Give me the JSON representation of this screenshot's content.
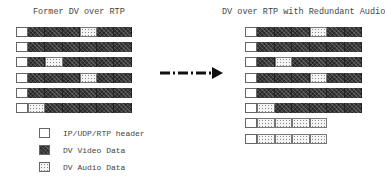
{
  "left_panel": {
    "title": "Former DV over RTP",
    "x": 16,
    "segment_width": 17.3,
    "rows": [
      {
        "y": 27,
        "segments": [
          "video",
          "video",
          "video",
          "audio",
          "video",
          "video"
        ]
      },
      {
        "y": 42,
        "segments": [
          "video",
          "video",
          "video",
          "video",
          "video",
          "video"
        ]
      },
      {
        "y": 57,
        "segments": [
          "video",
          "audio",
          "video",
          "video",
          "video",
          "video"
        ]
      },
      {
        "y": 73,
        "segments": [
          "video",
          "video",
          "video",
          "audio",
          "video",
          "video"
        ]
      },
      {
        "y": 88,
        "segments": [
          "video",
          "video",
          "video",
          "video",
          "video",
          "video"
        ]
      },
      {
        "y": 103,
        "segments": [
          "audio",
          "video",
          "video",
          "video",
          "video",
          "video"
        ]
      }
    ]
  },
  "right_panel": {
    "title": "DV over RTP with Redundant Audio",
    "x": 245,
    "segment_width": 17.5,
    "rows": [
      {
        "y": 27,
        "segments": [
          "video",
          "video",
          "video",
          "audio",
          "video",
          "video"
        ]
      },
      {
        "y": 42,
        "segments": [
          "video",
          "video",
          "video",
          "video",
          "video",
          "video"
        ]
      },
      {
        "y": 57,
        "segments": [
          "video",
          "audio",
          "video",
          "video",
          "video",
          "video"
        ]
      },
      {
        "y": 73,
        "segments": [
          "video",
          "video",
          "video",
          "audio",
          "video",
          "video"
        ]
      },
      {
        "y": 88,
        "segments": [
          "video",
          "video",
          "video",
          "video",
          "video",
          "video"
        ]
      },
      {
        "y": 103,
        "segments": [
          "audio",
          "video",
          "video",
          "video",
          "video",
          "video"
        ]
      },
      {
        "y": 118,
        "segments": [
          "audio",
          "audio",
          "audio",
          "audio"
        ]
      },
      {
        "y": 134,
        "segments": [
          "audio",
          "audio",
          "audio",
          "audio"
        ]
      }
    ]
  },
  "arrow": {
    "label": "transform-arrow",
    "style": "dash-dot"
  },
  "legend": [
    {
      "type": "header",
      "label": "IP/UDP/RTP header",
      "y": 128
    },
    {
      "type": "video",
      "label": "DV Video Data",
      "y": 145
    },
    {
      "type": "audio",
      "label": "DV Audio Data",
      "y": 162
    }
  ],
  "colors": {
    "video": "#3a3a3a",
    "audio": "#f4f4f4",
    "header": "#ffffff",
    "border": "#666666"
  }
}
